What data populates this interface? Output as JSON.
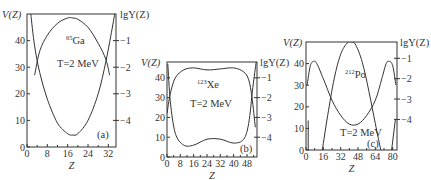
{
  "chart_data": [
    {
      "type": "line",
      "panel_label": "(a)",
      "nucleus": {
        "mass": "65",
        "symbol": "Ga"
      },
      "temperature": "T=2 MeV",
      "xlabel": "Z",
      "ylabel_left": "V(Z)",
      "ylabel_right": "lgY(Z)",
      "xlim": [
        0,
        35
      ],
      "ylim_left": [
        0,
        50
      ],
      "ylim_right": [
        -5,
        0
      ],
      "xticks": [
        0,
        8,
        16,
        24,
        32
      ],
      "yticks_left": [
        0,
        10,
        20,
        30,
        40
      ],
      "yticks_right": [
        -1,
        -2,
        -3,
        -4
      ],
      "series": [
        {
          "name": "V(Z)",
          "axis": "left",
          "x": [
            3,
            5,
            8,
            12,
            16,
            18,
            20,
            24,
            28,
            31,
            32.5
          ],
          "y": [
            27,
            36,
            42,
            46.5,
            48.5,
            48.5,
            48,
            45,
            39,
            33,
            27
          ]
        },
        {
          "name": "lgY(Z)",
          "axis": "right",
          "x": [
            1.5,
            3,
            5,
            8,
            12,
            16,
            18,
            20,
            24,
            28,
            31,
            33,
            34.5
          ],
          "y": [
            0,
            -1.2,
            -2.2,
            -3.2,
            -4.1,
            -4.5,
            -4.55,
            -4.5,
            -4.0,
            -3.0,
            -1.8,
            -0.8,
            0
          ]
        }
      ]
    },
    {
      "type": "line",
      "panel_label": "(b)",
      "nucleus": {
        "mass": "123",
        "symbol": "Xe"
      },
      "temperature": "T=2 MeV",
      "xlabel": "Z",
      "ylabel_left": "V(Z)",
      "ylabel_right": "lgY(Z)",
      "xlim": [
        0,
        54
      ],
      "ylim_left": [
        0,
        48
      ],
      "ylim_right": [
        -5,
        -0.2
      ],
      "xticks": [
        0,
        8,
        16,
        24,
        32,
        40,
        48
      ],
      "yticks_left": [
        0,
        10,
        20,
        30,
        40
      ],
      "yticks_right": [
        -1,
        -2,
        -3,
        -4
      ],
      "series": [
        {
          "name": "V(Z)",
          "axis": "left",
          "x": [
            0,
            2,
            5,
            10,
            16,
            24,
            32,
            40,
            46,
            49,
            51,
            53
          ],
          "y": [
            22,
            32,
            40,
            44,
            45,
            44,
            44.5,
            45,
            43,
            39,
            30,
            15
          ]
        },
        {
          "name": "lgY(Z)",
          "axis": "right",
          "x": [
            0.5,
            2,
            5,
            10,
            16,
            24,
            32,
            40,
            46,
            49,
            51.5,
            53.5
          ],
          "y": [
            -0.3,
            -2.2,
            -3.8,
            -4.4,
            -4.4,
            -4.1,
            -4.1,
            -4.3,
            -4.1,
            -3.3,
            -1.5,
            -0.2
          ]
        }
      ]
    },
    {
      "type": "line",
      "panel_label": "(c)",
      "nucleus": {
        "mass": "212",
        "symbol": "Po"
      },
      "temperature": "T=2 MeV",
      "xlabel": "Z",
      "ylabel_left": "V(Z)",
      "ylabel_right": "lgY(Z)",
      "xlim": [
        0,
        84
      ],
      "ylim_left": [
        0,
        50
      ],
      "ylim_right": [
        -5.5,
        -0.2
      ],
      "xticks": [
        0,
        16,
        32,
        48,
        64,
        80
      ],
      "yticks_left": [
        0,
        10,
        20,
        30,
        40
      ],
      "yticks_right": [
        -1,
        -2,
        -3,
        -4
      ],
      "series": [
        {
          "name": "V(Z)",
          "axis": "left",
          "x": [
            1,
            4,
            7,
            10,
            16,
            24,
            32,
            40,
            48,
            56,
            64,
            70,
            74,
            77,
            80,
            83
          ],
          "y": [
            30,
            39,
            41,
            40,
            33,
            23,
            16,
            12,
            12,
            16,
            23,
            33,
            40,
            41,
            39,
            30
          ]
        },
        {
          "name": "lgY(Z)",
          "axis": "right",
          "x": [
            15,
            20,
            26,
            32,
            38,
            42,
            46,
            52,
            58,
            64,
            69
          ],
          "y": [
            -5.5,
            -3.8,
            -2.0,
            -0.8,
            -0.25,
            -0.2,
            -0.35,
            -1.2,
            -2.6,
            -4.2,
            -5.5
          ]
        },
        {
          "name": "lgY(Z) edge-left",
          "axis": "right",
          "x": [
            2,
            2
          ],
          "y": [
            -4.05,
            -5.5
          ]
        },
        {
          "name": "lgY(Z) edge-right",
          "axis": "right",
          "x": [
            79,
            82.5
          ],
          "y": [
            -5.5,
            -4.0
          ]
        }
      ]
    }
  ]
}
